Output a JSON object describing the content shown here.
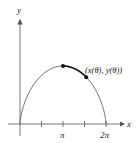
{
  "diagram": {
    "type": "cycloid-arch",
    "axes": {
      "x_label": "x",
      "y_label": "y",
      "x_ticks": [
        {
          "label": ""
        },
        {
          "label": "π"
        },
        {
          "label": ""
        },
        {
          "label": "2π"
        }
      ]
    },
    "point_label": "(x(θ), y(θ))",
    "colors": {
      "curve": "#555555",
      "highlight": "#111111",
      "axis": "#555555",
      "text": "#222222"
    }
  }
}
